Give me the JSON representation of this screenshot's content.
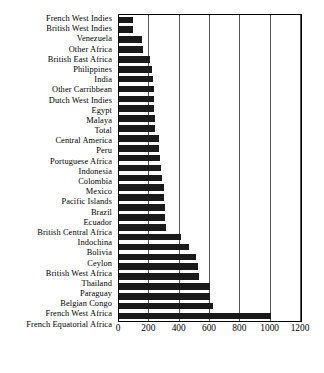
{
  "chart_data": {
    "type": "bar",
    "orientation": "horizontal",
    "title": "",
    "subtitle": "",
    "xlabel": "",
    "ylabel": "",
    "xlim": [
      0,
      1200
    ],
    "ylim": null,
    "grid": true,
    "grid_axis": "x",
    "legend": null,
    "legend_position": "none",
    "xticks": [
      0,
      200,
      400,
      600,
      800,
      1000,
      1200
    ],
    "xtick_labels": [
      "0",
      "200",
      "400",
      "600",
      "800",
      "1000",
      "1200"
    ],
    "bar_color": "#1a1a1a",
    "categories": [
      "French West Indies",
      "British West Indies",
      "Venezuela",
      "Other Africa",
      "British East Africa",
      "Philippines",
      "India",
      "Other Carribbean",
      "Dutch West Indies",
      "Egypt",
      "Malaya",
      "Total",
      "Central America",
      "Peru",
      "Portuguese Africa",
      "Indonesia",
      "Colombia",
      "Mexico",
      "Pacific Islands",
      "Brazil",
      "Ecuador",
      "British Central Africa",
      "Indochina",
      "Bolivia",
      "Ceylon",
      "British West Africa",
      "Thailand",
      "Paraguay",
      "Belgian Congo",
      "French West Africa",
      "French Equatorial Africa"
    ],
    "values": [
      90,
      90,
      150,
      160,
      205,
      215,
      225,
      230,
      230,
      230,
      235,
      240,
      265,
      265,
      270,
      280,
      285,
      295,
      295,
      300,
      300,
      310,
      410,
      460,
      510,
      520,
      530,
      600,
      600,
      620,
      1000
    ]
  },
  "axis": {
    "x_origin_px": 118,
    "x_max_px": 300
  }
}
